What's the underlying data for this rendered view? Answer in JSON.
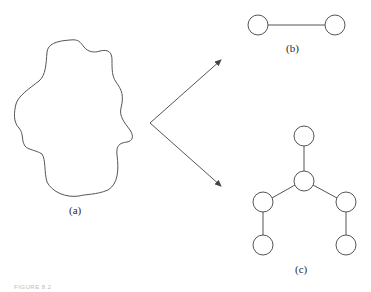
{
  "labels": {
    "a": "(a)",
    "b": "(b)",
    "c": "(c)"
  },
  "caption": "FIGURE 8.2",
  "colors": {
    "line": "#555555",
    "text": "#2a2a2a",
    "background": "#ffffff"
  },
  "shapes": {
    "blob": "region outline",
    "graph_b": {
      "nodes": 2,
      "edges": 1
    },
    "graph_c": {
      "nodes": 6,
      "edges": 5
    }
  }
}
